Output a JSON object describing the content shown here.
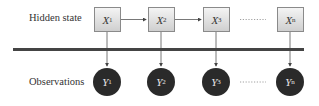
{
  "diagram": {
    "rows": {
      "hidden_label": "Hidden state",
      "observed_label": "Observations"
    },
    "hidden_nodes": [
      {
        "var": "X",
        "sub": "1"
      },
      {
        "var": "X",
        "sub": "2"
      },
      {
        "var": "X",
        "sub": "3"
      },
      {
        "var": "X",
        "sub": "n"
      }
    ],
    "observed_nodes": [
      {
        "var": "Y",
        "sub": "1"
      },
      {
        "var": "Y",
        "sub": "2"
      },
      {
        "var": "Y",
        "sub": "3"
      },
      {
        "var": "Y",
        "sub": "n"
      }
    ],
    "ellipsis": "·········",
    "colors": {
      "box_border": "#8a8a8a",
      "circle_fill": "#2a2a2a",
      "line": "#444444"
    }
  }
}
